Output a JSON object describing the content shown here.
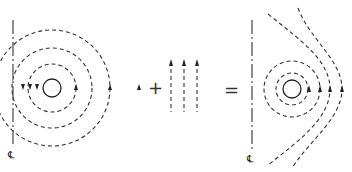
{
  "diagram": {
    "title": "",
    "panels": [
      {
        "name": "circulating-flow",
        "description": "Line vortex around cylinder near centerline: concentric dashed circles, arrows down on left and up on right"
      },
      {
        "name": "uniform-flow",
        "description": "Uniform parallel flow upward (three dashed lines with arrows)"
      },
      {
        "name": "combined-flow",
        "description": "Superposition: circulation plus uniform flow, streamlines bend around cylinder"
      }
    ],
    "operators": {
      "plus": "+",
      "equals": "="
    },
    "centerline_label": "℄",
    "colors": {
      "line": "#333333",
      "background": "#ffffff"
    }
  }
}
